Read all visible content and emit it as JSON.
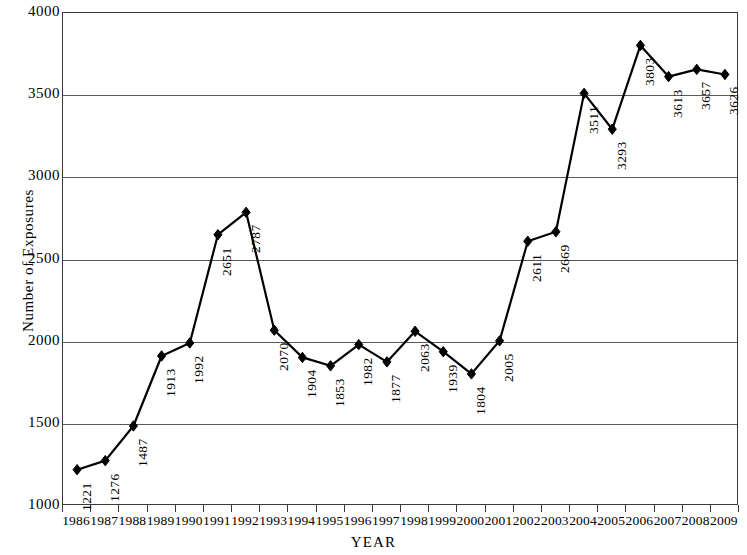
{
  "chart_data": {
    "type": "line",
    "title": "",
    "xlabel": "YEAR",
    "ylabel": "Number of Exposures",
    "ylim": [
      1000,
      4000
    ],
    "ytick_labels": [
      "4000",
      "3500",
      "3000",
      "2500",
      "2000",
      "1500",
      "1000"
    ],
    "yticks": [
      4000,
      3500,
      3000,
      2500,
      2000,
      1500,
      1000
    ],
    "grid": true,
    "grid_axis": "y",
    "legend": "none",
    "marker": "diamond",
    "line_color": "#000000",
    "marker_color": "#000000",
    "grid_color": "#5a5a5a",
    "categories": [
      "1986",
      "1987",
      "1988",
      "1989",
      "1990",
      "1991",
      "1992",
      "1993",
      "1994",
      "1995",
      "1996",
      "1997",
      "1998",
      "1999",
      "2000",
      "2001",
      "2002",
      "2003",
      "2004",
      "2005",
      "2006",
      "2007",
      "2008",
      "2009"
    ],
    "values": [
      1221,
      1276,
      1487,
      1913,
      1992,
      2651,
      2787,
      2070,
      1904,
      1853,
      1982,
      1877,
      2063,
      1939,
      1804,
      2005,
      2611,
      2669,
      3511,
      3293,
      3803,
      3613,
      3657,
      3626
    ],
    "point_labels": [
      "1221",
      "1276",
      "1487",
      "1913",
      "1992",
      "2651",
      "2787",
      "2070",
      "1904",
      "1853",
      "1982",
      "1877",
      "2063",
      "1939",
      "1804",
      "2005",
      "2611",
      "2669",
      "3511",
      "3293",
      "3803",
      "3613",
      "3657",
      "3626"
    ]
  }
}
